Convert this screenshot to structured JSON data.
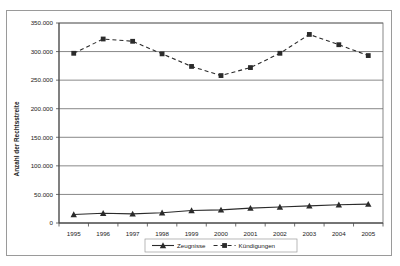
{
  "chart_data": {
    "type": "line",
    "title": "",
    "xlabel": "",
    "ylabel": "Anzahl der Rechtsstreite",
    "categories": [
      "1995",
      "1996",
      "1997",
      "1998",
      "1999",
      "2000",
      "2001",
      "2002",
      "2003",
      "2004",
      "2005"
    ],
    "ylim": [
      0,
      350000
    ],
    "ytick_values": [
      0,
      50000,
      100000,
      150000,
      200000,
      250000,
      300000,
      350000
    ],
    "ytick_labels": [
      "0",
      "50.000",
      "100.000",
      "150.000",
      "200.000",
      "250.000",
      "300.000",
      "350.000"
    ],
    "grid": "horizontal",
    "legend_position": "bottom-center",
    "series": [
      {
        "name": "Zeugnisse",
        "marker": "triangle",
        "line_style": "solid",
        "color": "#2b2b2b",
        "values": [
          15000,
          17000,
          16000,
          18000,
          22000,
          23000,
          26000,
          28000,
          30000,
          32000,
          33000
        ]
      },
      {
        "name": "Kündigungen",
        "marker": "square",
        "line_style": "dashed",
        "color": "#2b2b2b",
        "values": [
          297000,
          322000,
          318000,
          296000,
          274000,
          258000,
          272000,
          297000,
          330000,
          312000,
          293000
        ]
      }
    ]
  },
  "legend": {
    "items": [
      {
        "label": "Zeugnisse"
      },
      {
        "label": "Kündigungen"
      }
    ]
  },
  "colors": {
    "axis": "#4a4a4a",
    "grid": "#6a6a6a",
    "series": "#2b2b2b",
    "frame": "#9a9a9a",
    "background": "#ffffff"
  }
}
